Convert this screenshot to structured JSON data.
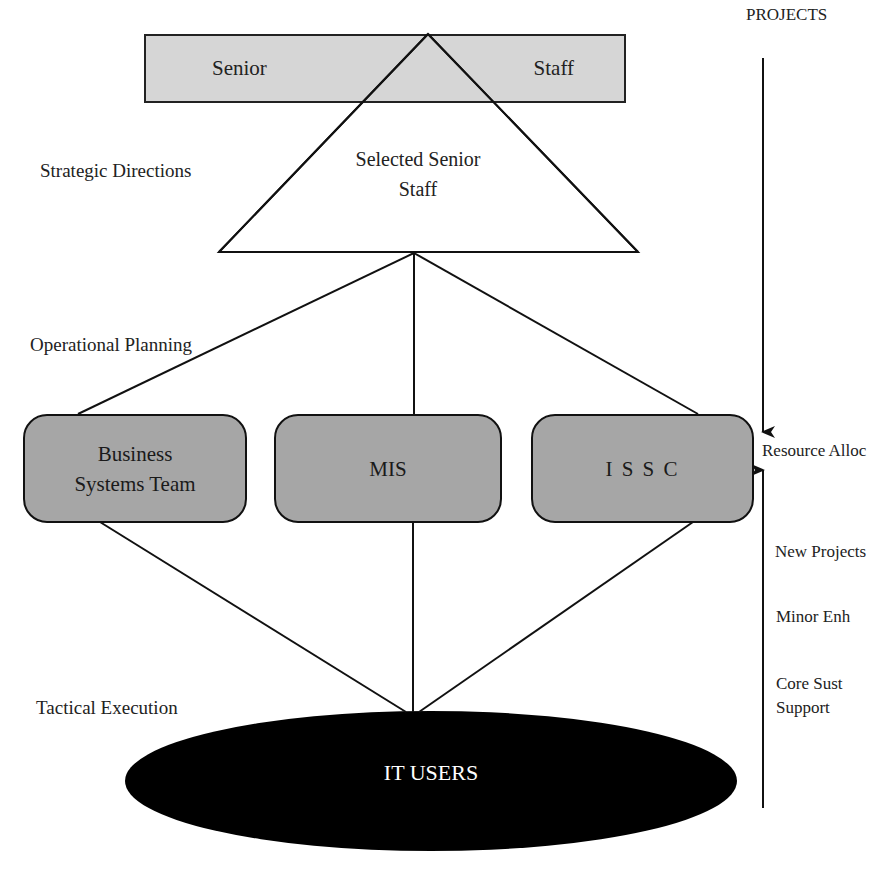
{
  "diagram": {
    "top_bar": {
      "left_label": "Senior",
      "right_label": "Staff",
      "fill": "#d6d6d6"
    },
    "triangle": {
      "line1": "Selected Senior",
      "line2": "Staff"
    },
    "left_labels": {
      "strategic": "Strategic Directions",
      "operational": "Operational Planning",
      "tactical": "Tactical Execution"
    },
    "teams": [
      {
        "line1": "Business",
        "line2": "Systems Team"
      },
      {
        "line1": "MIS"
      },
      {
        "line1": "I S S C"
      }
    ],
    "team_fill": "#a6a6a6",
    "users": {
      "label": "IT USERS",
      "fill": "#000000"
    },
    "right_axis": {
      "top_label": "PROJECTS",
      "middle_label": "Resource Alloc",
      "bottom_labels": [
        "New Projects",
        "Minor Enh",
        "Core Sust",
        "Support"
      ]
    }
  }
}
